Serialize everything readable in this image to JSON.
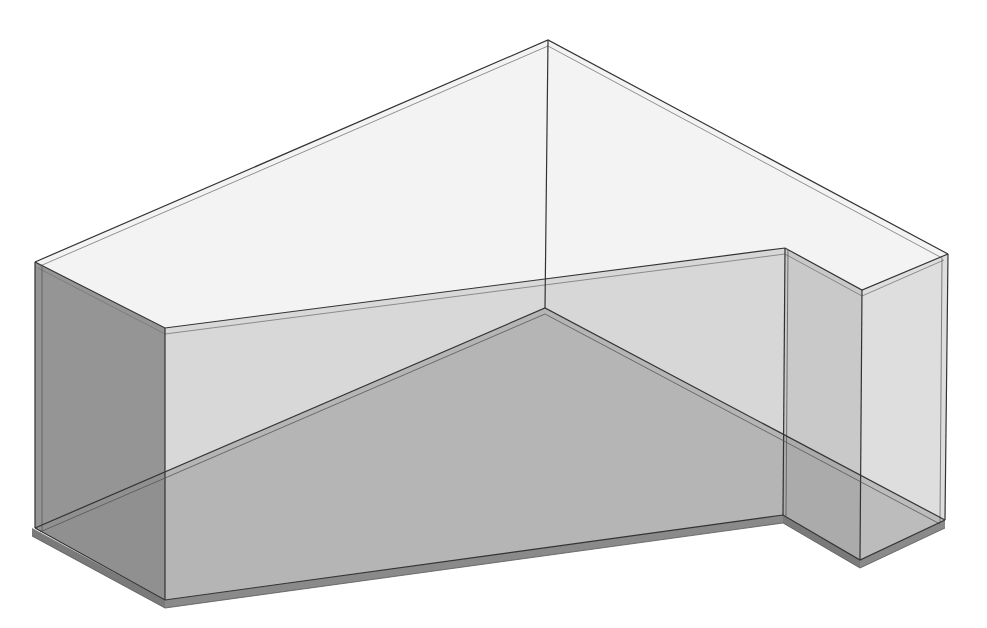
{
  "diagram": {
    "title": "",
    "colors": {
      "background": "#ffffff",
      "top_face": "#f2f2f2",
      "back_wall_light": "#dcdcdc",
      "floor": "#a3a3a3",
      "left_wall": "#8e8e8e",
      "front_wall": "#b9b9b9",
      "slab_edge": "#7a7a7a",
      "edge_line": "#333333"
    },
    "vertices": {
      "top_apex": [
        548,
        40
      ],
      "top_left": [
        35,
        262
      ],
      "top_front_left": [
        165,
        328
      ],
      "top_notch_inner": [
        785,
        248
      ],
      "top_notch_corner": [
        862,
        290
      ],
      "top_right": [
        948,
        254
      ],
      "floor_back_apex": [
        545,
        308
      ],
      "bottom_left": [
        32,
        528
      ],
      "bottom_front_left": [
        165,
        600
      ],
      "bottom_notch_inner": [
        783,
        515
      ],
      "bottom_notch_corner": [
        860,
        560
      ],
      "bottom_right": [
        945,
        520
      ]
    }
  }
}
